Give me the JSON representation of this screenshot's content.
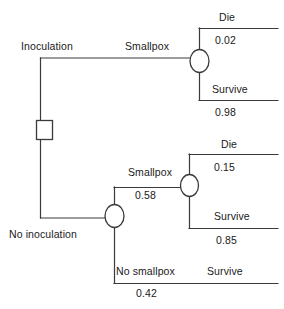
{
  "diagram": {
    "type": "decision-tree",
    "stroke_color": "#3a3a3a",
    "text_color": "#1a1a1a",
    "background": "#ffffff"
  },
  "nodes": {
    "decision": {
      "shape": "square",
      "label": ""
    },
    "chance_inoculation": {
      "shape": "circle",
      "label": ""
    },
    "chance_no_inoculation": {
      "shape": "circle",
      "label": ""
    },
    "chance_no_inoc_smallpox": {
      "shape": "circle",
      "label": ""
    }
  },
  "branches": {
    "inoculation": {
      "label": "Inoculation",
      "prob": ""
    },
    "inoc_smallpox": {
      "label": "Smallpox",
      "prob": ""
    },
    "inoc_die": {
      "label": "Die",
      "prob": "0.02"
    },
    "inoc_survive": {
      "label": "Survive",
      "prob": "0.98"
    },
    "no_inoculation": {
      "label": "No inoculation",
      "prob": ""
    },
    "no_inoc_smallpox": {
      "label": "Smallpox",
      "prob": "0.58"
    },
    "no_inoc_smallpox_die": {
      "label": "Die",
      "prob": "0.15"
    },
    "no_inoc_smallpox_survive": {
      "label": "Survive",
      "prob": "0.85"
    },
    "no_inoc_no_smallpox": {
      "label": "No smallpox",
      "prob": "0.42"
    },
    "no_inoc_no_smallpox_survive": {
      "label": "Survive",
      "prob": ""
    }
  }
}
